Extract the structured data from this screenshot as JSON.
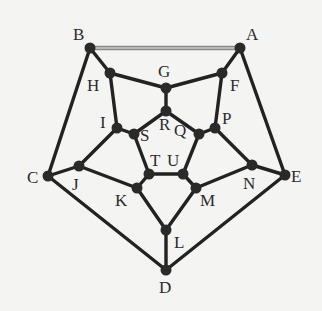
{
  "diagram": {
    "type": "dodecahedron-graph",
    "colors": {
      "edge": "#222222",
      "node": "#2a2a2a",
      "label": "#2b2b2b",
      "highlight_edge": "#8a8a8a",
      "highlight_core": "#c8c8c8",
      "background": "#f4f4f2"
    },
    "nodes": [
      {
        "id": "A",
        "x": 240,
        "y": 48,
        "lx": 246,
        "ly": 40
      },
      {
        "id": "B",
        "x": 90,
        "y": 48,
        "lx": 73,
        "ly": 40
      },
      {
        "id": "C",
        "x": 48,
        "y": 176,
        "lx": 27,
        "ly": 183
      },
      {
        "id": "D",
        "x": 166,
        "y": 270,
        "lx": 159,
        "ly": 293
      },
      {
        "id": "E",
        "x": 285,
        "y": 175,
        "lx": 291,
        "ly": 182
      },
      {
        "id": "F",
        "x": 222,
        "y": 73,
        "lx": 230,
        "ly": 91
      },
      {
        "id": "G",
        "x": 166,
        "y": 88,
        "lx": 158,
        "ly": 77
      },
      {
        "id": "H",
        "x": 110,
        "y": 73,
        "lx": 87,
        "ly": 91
      },
      {
        "id": "I",
        "x": 117,
        "y": 128,
        "lx": 100,
        "ly": 128
      },
      {
        "id": "J",
        "x": 79,
        "y": 166,
        "lx": 72,
        "ly": 190
      },
      {
        "id": "K",
        "x": 137,
        "y": 188,
        "lx": 115,
        "ly": 206
      },
      {
        "id": "L",
        "x": 166,
        "y": 230,
        "lx": 174,
        "ly": 248
      },
      {
        "id": "M",
        "x": 196,
        "y": 188,
        "lx": 200,
        "ly": 206
      },
      {
        "id": "N",
        "x": 252,
        "y": 165,
        "lx": 243,
        "ly": 189
      },
      {
        "id": "P",
        "x": 215,
        "y": 128,
        "lx": 222,
        "ly": 124
      },
      {
        "id": "Q",
        "x": 199,
        "y": 134,
        "lx": 174,
        "ly": 136
      },
      {
        "id": "R",
        "x": 166,
        "y": 111,
        "lx": 159,
        "ly": 130
      },
      {
        "id": "S",
        "x": 134,
        "y": 134,
        "lx": 140,
        "ly": 141
      },
      {
        "id": "T",
        "x": 149,
        "y": 174,
        "lx": 150,
        "ly": 166
      },
      {
        "id": "U",
        "x": 183,
        "y": 174,
        "lx": 167,
        "ly": 166
      }
    ],
    "edges": [
      {
        "from": "B",
        "to": "A",
        "highlight": true
      },
      {
        "from": "A",
        "to": "E"
      },
      {
        "from": "E",
        "to": "D"
      },
      {
        "from": "D",
        "to": "C"
      },
      {
        "from": "C",
        "to": "B"
      },
      {
        "from": "B",
        "to": "H"
      },
      {
        "from": "A",
        "to": "F"
      },
      {
        "from": "C",
        "to": "J"
      },
      {
        "from": "E",
        "to": "N"
      },
      {
        "from": "D",
        "to": "L"
      },
      {
        "from": "H",
        "to": "G"
      },
      {
        "from": "G",
        "to": "F"
      },
      {
        "from": "F",
        "to": "P"
      },
      {
        "from": "P",
        "to": "N"
      },
      {
        "from": "N",
        "to": "M"
      },
      {
        "from": "M",
        "to": "L"
      },
      {
        "from": "L",
        "to": "K"
      },
      {
        "from": "K",
        "to": "J"
      },
      {
        "from": "J",
        "to": "I"
      },
      {
        "from": "I",
        "to": "H"
      },
      {
        "from": "G",
        "to": "R"
      },
      {
        "from": "P",
        "to": "Q"
      },
      {
        "from": "M",
        "to": "U"
      },
      {
        "from": "K",
        "to": "T"
      },
      {
        "from": "I",
        "to": "S"
      },
      {
        "from": "R",
        "to": "Q"
      },
      {
        "from": "Q",
        "to": "U"
      },
      {
        "from": "U",
        "to": "T"
      },
      {
        "from": "T",
        "to": "S"
      },
      {
        "from": "S",
        "to": "R"
      }
    ]
  }
}
